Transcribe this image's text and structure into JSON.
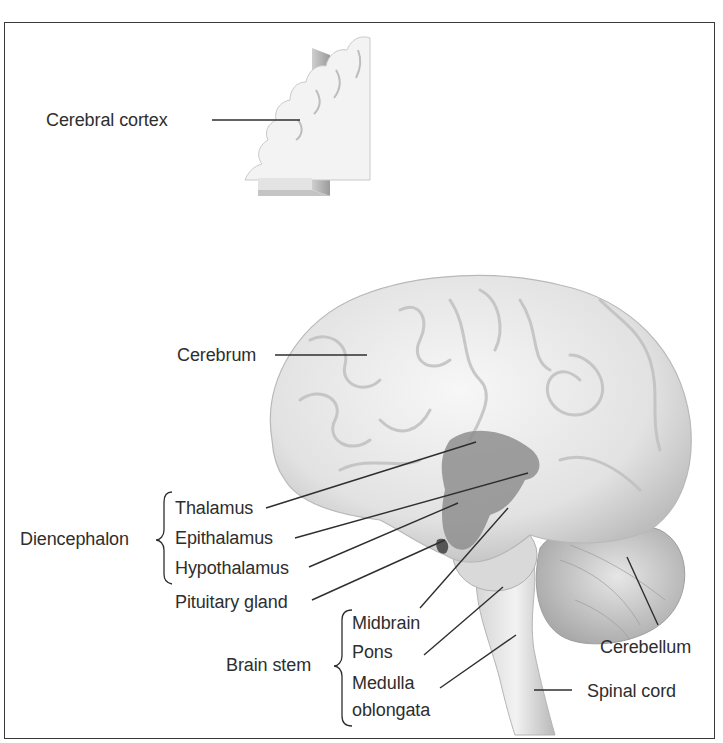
{
  "figure": {
    "top_inset": {
      "label": "Cerebral cortex"
    },
    "labels": {
      "cerebrum": "Cerebrum",
      "diencephalon": "Diencephalon",
      "thalamus": "Thalamus",
      "epithalamus": "Epithalamus",
      "hypothalamus": "Hypothalamus",
      "pituitary": "Pituitary gland",
      "brain_stem": "Brain stem",
      "midbrain": "Midbrain",
      "pons": "Pons",
      "medulla_line1": "Medulla",
      "medulla_line2": "oblongata",
      "cerebellum": "Cerebellum",
      "spinal_cord": "Spinal cord"
    },
    "groups": [
      {
        "name": "Diencephalon",
        "members": [
          "Thalamus",
          "Epithalamus",
          "Hypothalamus"
        ]
      },
      {
        "name": "Brain stem",
        "members": [
          "Midbrain",
          "Pons",
          "Medulla oblongata"
        ]
      }
    ],
    "colors": {
      "frame": "#3a3a3a",
      "text": "#2e2e2e",
      "brain_light": "#ececec",
      "brain_mid": "#c8c8c8",
      "diencephalon_dark": "#8a8a8a"
    }
  }
}
